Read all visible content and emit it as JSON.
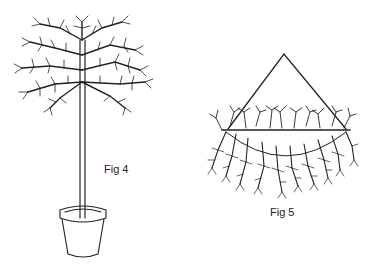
{
  "figures": [
    {
      "id": "fig4",
      "label": "Fig 4",
      "subject": "standard tree in a flower pot"
    },
    {
      "id": "fig5",
      "label": "Fig 5",
      "subject": "hanging basket with trailing branches"
    }
  ],
  "colors": {
    "ink": "#222222",
    "background": "#ffffff"
  }
}
